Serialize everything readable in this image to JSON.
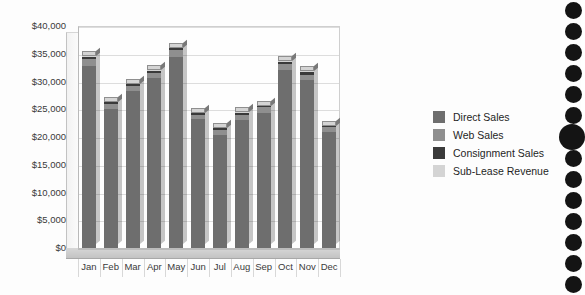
{
  "chart_data": {
    "type": "bar",
    "subtype": "stacked-column-3d",
    "title": "",
    "xlabel": "",
    "ylabel": "",
    "ylim": [
      0,
      40000
    ],
    "ytick_step": 5000,
    "ytick_labels": [
      "$40,000",
      "$35,000",
      "$30,000",
      "$25,000",
      "$20,000",
      "$15,000",
      "$10,000",
      "$5,000",
      "$0"
    ],
    "ytick_values": [
      40000,
      35000,
      30000,
      25000,
      20000,
      15000,
      10000,
      5000,
      0
    ],
    "grid": true,
    "legend_position": "right",
    "categories": [
      "Jan",
      "Feb",
      "Mar",
      "Apr",
      "May",
      "Jun",
      "Jul",
      "Aug",
      "Sep",
      "Oct",
      "Nov",
      "Dec"
    ],
    "series": [
      {
        "name": "Direct Sales",
        "color": "#6e6e6e",
        "values": [
          32800,
          25000,
          28300,
          30600,
          34400,
          23200,
          20400,
          23100,
          24400,
          32000,
          30200,
          20900
        ]
      },
      {
        "name": "Web Sales",
        "color": "#8f8f8f",
        "values": [
          1200,
          900,
          950,
          1000,
          1200,
          800,
          850,
          900,
          950,
          1100,
          1050,
          850
        ]
      },
      {
        "name": "Consignment Sales",
        "color": "#3a3a3a",
        "values": [
          500,
          400,
          350,
          350,
          450,
          300,
          350,
          350,
          250,
          450,
          450,
          250
        ]
      },
      {
        "name": "Sub-Lease Revenue",
        "color": "#d4d4d4",
        "values": [
          300,
          200,
          200,
          250,
          250,
          200,
          200,
          250,
          200,
          250,
          300,
          200
        ]
      }
    ],
    "totals": [
      34800,
      26500,
      29800,
      32200,
      36300,
      24500,
      21800,
      24600,
      25800,
      33800,
      32000,
      22200
    ]
  },
  "legend": {
    "items": [
      {
        "label": "Direct Sales",
        "color": "#6e6e6e"
      },
      {
        "label": "Web Sales",
        "color": "#8f8f8f"
      },
      {
        "label": "Consignment Sales",
        "color": "#3a3a3a"
      },
      {
        "label": "Sub-Lease Revenue",
        "color": "#d4d4d4"
      }
    ]
  },
  "page": {
    "background_color": "#fdfdfd",
    "binder_holes_count": 14
  }
}
